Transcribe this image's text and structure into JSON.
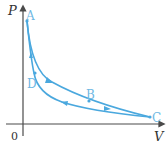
{
  "diagram": {
    "type": "P-V diagram (cycle)",
    "axes": {
      "y_label": "P",
      "x_label": "V",
      "origin_label": "0"
    },
    "points": [
      {
        "name": "A",
        "label": "A"
      },
      {
        "name": "B",
        "label": "B"
      },
      {
        "name": "C",
        "label": "C"
      },
      {
        "name": "D",
        "label": "D"
      }
    ],
    "paths": [
      {
        "from": "A",
        "to": "C",
        "via": "B",
        "direction": "A→B→C"
      },
      {
        "from": "C",
        "to": "A",
        "via": "D",
        "direction": "C→D→A"
      }
    ],
    "colors": {
      "curve": "#4aa8de",
      "axis": "#4a4a4a",
      "point_label": "#6fb8e3"
    }
  }
}
